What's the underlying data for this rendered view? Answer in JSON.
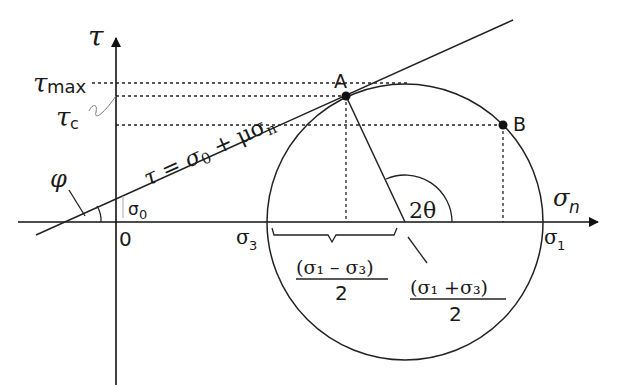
{
  "diagram": {
    "axes": {
      "y_label": "τ",
      "x_label_main": "σ",
      "x_label_sub": "n",
      "origin_label": "0"
    },
    "tau_labels": {
      "tau_max_main": "τ",
      "tau_max_sub": "max",
      "tau_c_main": "τ",
      "tau_c_sub": "c"
    },
    "envelope": {
      "equation_prefix": "τ = σ",
      "equation_sub0": "0",
      "equation_mid": " + μσ",
      "equation_subn": "n",
      "intercept_main": "σ",
      "intercept_sub": "0",
      "angle_label": "φ"
    },
    "points": {
      "A": "A",
      "B": "B"
    },
    "stress_labels": {
      "sigma3_main": "σ",
      "sigma3_sub": "3",
      "sigma1_main": "σ",
      "sigma1_sub": "1",
      "angle_2theta": "2θ"
    },
    "fractions": {
      "radius_num": "(σ₁ – σ₃)",
      "radius_den": "2",
      "center_num": "(σ₁ +σ₃)",
      "center_den": "2"
    }
  }
}
